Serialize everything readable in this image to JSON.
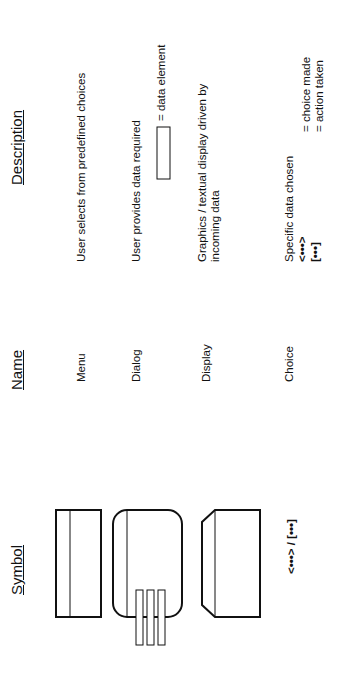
{
  "headers": {
    "symbol": "Symbol",
    "name": "Name",
    "description": "Description"
  },
  "rows": [
    {
      "symbol": "menu-rectangle",
      "name": "Menu",
      "description": "User selects from predefined choices"
    },
    {
      "symbol": "dialog-rounded-rectangle-with-tabs",
      "name": "Dialog",
      "description": "User provides data required",
      "legend_text": "= data element"
    },
    {
      "symbol": "display-octagon",
      "name": "Display",
      "description_line1": "Graphics / textual display driven by",
      "description_line2": "incoming data"
    },
    {
      "symbol_text": "<•••> / [•••]",
      "name": "Choice",
      "description": "Specific data chosen",
      "choice_symbol": "<•••>",
      "choice_meaning": "= choice made",
      "action_symbol": "[•••]",
      "action_meaning": "= action taken"
    }
  ]
}
